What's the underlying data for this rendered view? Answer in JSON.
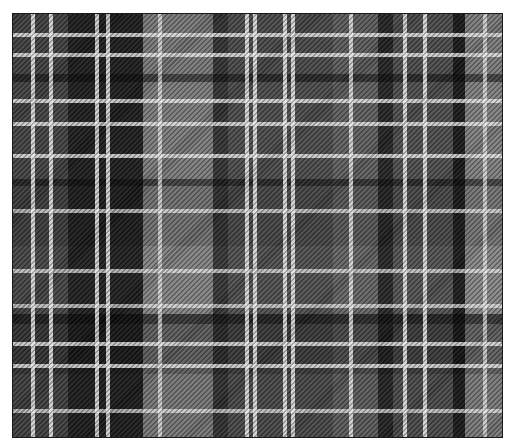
{
  "image": {
    "subject": "grayscale tartan plaid fabric with twill weave",
    "palette": {
      "dark": "#1e1e1e",
      "mid": "#555555",
      "light": "#8a8a8a",
      "overcheck": "#ebebeb",
      "border": "#1a1a1a",
      "background": "#ffffff"
    }
  }
}
